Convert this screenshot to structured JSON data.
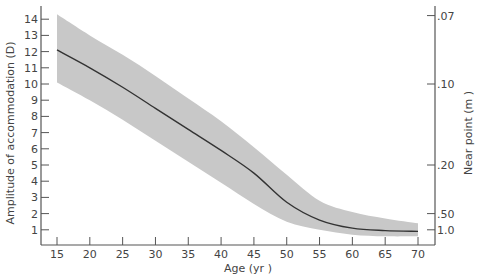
{
  "chart_data": {
    "type": "line",
    "title": "",
    "xlabel": "Age (yr )",
    "ylabel": "Amplitude of accommodation (D)",
    "y2label": "Near point (m )",
    "xlim": [
      15,
      70
    ],
    "ylim": [
      0,
      14.5
    ],
    "xticks": [
      15,
      20,
      25,
      30,
      35,
      40,
      45,
      50,
      55,
      60,
      65,
      70
    ],
    "yticks": [
      1,
      2,
      3,
      4,
      5,
      6,
      7,
      8,
      9,
      10,
      11,
      12,
      13,
      14
    ],
    "y2ticks": [
      {
        "label": ".07",
        "diopters": 14.1
      },
      {
        "label": ".10",
        "diopters": 10.0
      },
      {
        "label": ".20",
        "diopters": 5.0
      },
      {
        "label": ".50",
        "diopters": 2.0
      },
      {
        "label": "1.0",
        "diopters": 1.0
      }
    ],
    "grid": false,
    "legend": null,
    "series": [
      {
        "name": "Mean amplitude",
        "x": [
          15,
          20,
          25,
          30,
          35,
          40,
          45,
          50,
          55,
          60,
          65,
          70
        ],
        "values": [
          12.1,
          11.0,
          9.8,
          8.5,
          7.2,
          5.9,
          4.5,
          2.7,
          1.6,
          1.1,
          0.95,
          0.9
        ]
      },
      {
        "name": "Range upper",
        "x": [
          15,
          20,
          25,
          30,
          35,
          40,
          45,
          50,
          55,
          60,
          65,
          70
        ],
        "values": [
          14.3,
          13.0,
          11.8,
          10.5,
          9.1,
          7.7,
          6.1,
          4.4,
          2.8,
          2.1,
          1.7,
          1.4
        ]
      },
      {
        "name": "Range lower",
        "x": [
          15,
          20,
          25,
          30,
          35,
          40,
          45,
          50,
          55,
          60,
          65,
          70
        ],
        "values": [
          10.1,
          9.0,
          7.8,
          6.5,
          5.2,
          3.9,
          2.6,
          1.5,
          1.0,
          0.7,
          0.6,
          0.6
        ]
      }
    ],
    "colors": {
      "band": "#c8c8c8",
      "line": "#333333",
      "axis": "#555555",
      "text": "#444444"
    }
  }
}
